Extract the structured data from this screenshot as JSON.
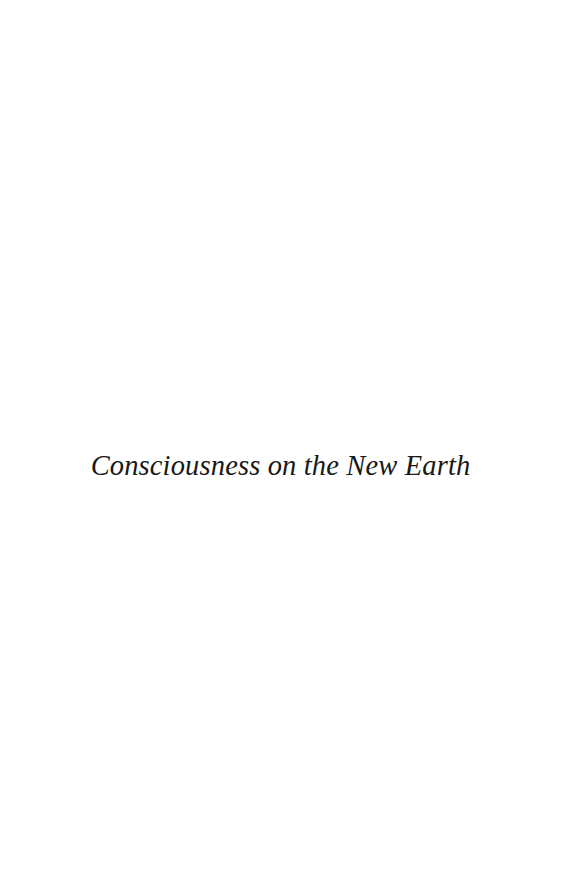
{
  "page": {
    "kind": "part-title-page",
    "background_color": "#ffffff",
    "width": 587,
    "height": 882
  },
  "title": {
    "text": "Consciousness on the New Earth",
    "color": "#191919",
    "style": "italic-serif"
  },
  "blank_regions": {
    "top_label": "",
    "bottom_label": ""
  }
}
